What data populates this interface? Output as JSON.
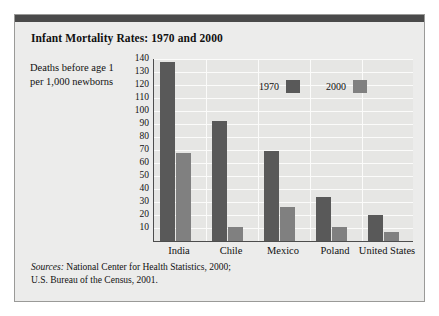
{
  "figure": {
    "title": "Infant Mortality Rates: 1970 and 2000",
    "axis_caption": "Deaths before age 1 per 1,000 newborns",
    "sources_lead": "Sources:",
    "sources_line1": " National Center for Health Statistics, 2000;",
    "sources_line2": "U.S. Bureau of the Census, 2001."
  },
  "colors": {
    "series_1970": "#595959",
    "series_2000": "#808080",
    "panel_background": "#ececeb",
    "plot_background": "#e6e6e4",
    "top_rule": "#4a4a4a",
    "axis": "#4d4d4d",
    "gridline": "#fbfbfa"
  },
  "legend": {
    "position": "inside-top-right",
    "entries": [
      {
        "label": "1970",
        "color": "#595959"
      },
      {
        "label": "2000",
        "color": "#808080"
      }
    ]
  },
  "chart_data": {
    "type": "bar",
    "title": "Infant Mortality Rates: 1970 and 2000",
    "xlabel": "",
    "ylabel": "Deaths before age 1 per 1,000 newborns",
    "categories": [
      "India",
      "Chile",
      "Mexico",
      "Poland",
      "United States"
    ],
    "series": [
      {
        "name": "1970",
        "color": "#595959",
        "values": [
          138,
          92,
          69,
          34,
          20
        ]
      },
      {
        "name": "2000",
        "color": "#808080",
        "values": [
          68,
          11,
          26,
          11,
          7
        ]
      }
    ],
    "ylim": [
      0,
      140
    ],
    "yticks": [
      10,
      20,
      30,
      40,
      50,
      60,
      70,
      80,
      90,
      100,
      110,
      120,
      130,
      140
    ],
    "ytick_labels": [
      "10",
      "20",
      "30",
      "40",
      "50",
      "60",
      "70",
      "80",
      "90",
      "100",
      "110",
      "120",
      "130",
      "140"
    ],
    "grid": true,
    "grid_axis": "y",
    "legend_entries": [
      "1970",
      "2000"
    ],
    "annotations": [
      "Sources: National Center for Health Statistics, 2000; U.S. Bureau of the Census, 2001."
    ]
  }
}
